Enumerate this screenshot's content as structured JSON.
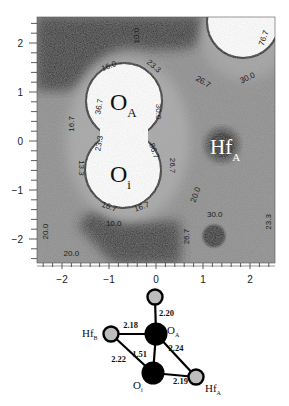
{
  "chart_data": {
    "type": "heatmap",
    "title": "",
    "xlabel": "",
    "ylabel": "",
    "xlim": [
      -2.53,
      2.53
    ],
    "ylim": [
      -2.49,
      2.53
    ],
    "x_ticks": [
      -2,
      -1,
      0,
      1,
      2
    ],
    "y_ticks": [
      2,
      1,
      0,
      -1,
      -2
    ],
    "x_tick_labels": [
      "−2",
      "−1",
      "0",
      "1",
      "2"
    ],
    "y_tick_labels": [
      "2",
      "1",
      "0",
      "−1",
      "−2"
    ],
    "minor_tick_step": 0.2,
    "colormap": "grayscale (dark = low, white = high)",
    "atoms_in_map": [
      {
        "name": "O_A",
        "label": "O",
        "subscript": "A",
        "x": -0.6,
        "y": 0.75,
        "type": "high-density-white"
      },
      {
        "name": "O_i",
        "label": "O",
        "subscript": "i",
        "x": -0.6,
        "y": -0.5,
        "type": "high-density-white"
      },
      {
        "name": "Hf_A",
        "label": "Hf",
        "subscript": "A",
        "x": 1.2,
        "y": 0.05,
        "type": "dark-core"
      },
      {
        "name": "top-right-atom",
        "label": "",
        "subscript": "",
        "x": 1.9,
        "y": 2.2,
        "type": "high-density-white"
      },
      {
        "name": "lower-right-dark-spot",
        "label": "",
        "subscript": "",
        "x": 1.2,
        "y": -1.9,
        "type": "dark-spot"
      }
    ],
    "contour_labels": [
      {
        "text": "10.0",
        "x": -0.4,
        "y": 2.15,
        "rotate": -90
      },
      {
        "text": "16.0",
        "x": -1.0,
        "y": 1.52,
        "rotate": -20
      },
      {
        "text": "23.3",
        "x": -0.05,
        "y": 1.52,
        "rotate": 40
      },
      {
        "text": "26.7",
        "x": 1.0,
        "y": 1.2,
        "rotate": 30
      },
      {
        "text": "30.0",
        "x": 1.95,
        "y": 1.28,
        "rotate": -25
      },
      {
        "text": "76.7",
        "x": 2.3,
        "y": 2.1,
        "rotate": -70
      },
      {
        "text": "30.0",
        "x": 0.05,
        "y": 0.6,
        "rotate": 90
      },
      {
        "text": "36.7",
        "x": -1.2,
        "y": 0.7,
        "rotate": -80
      },
      {
        "text": "16.7",
        "x": -1.8,
        "y": 0.35,
        "rotate": -90
      },
      {
        "text": "23.3",
        "x": -1.2,
        "y": -0.05,
        "rotate": -80
      },
      {
        "text": "86.7",
        "x": -0.05,
        "y": -0.2,
        "rotate": 70
      },
      {
        "text": "26.7",
        "x": 0.35,
        "y": -0.5,
        "rotate": 90
      },
      {
        "text": "13.3",
        "x": -1.6,
        "y": -0.55,
        "rotate": 90
      },
      {
        "text": "20.0",
        "x": 0.85,
        "y": -1.1,
        "rotate": -70
      },
      {
        "text": "30.0",
        "x": 1.25,
        "y": -1.5,
        "rotate": 0
      },
      {
        "text": "23.3",
        "x": 2.4,
        "y": -1.65,
        "rotate": -90
      },
      {
        "text": "26.7",
        "x": 0.65,
        "y": -1.95,
        "rotate": -90
      },
      {
        "text": "16.7",
        "x": -1.0,
        "y": -1.35,
        "rotate": 20
      },
      {
        "text": "16.7",
        "x": -0.3,
        "y": -1.35,
        "rotate": -20
      },
      {
        "text": "10.0",
        "x": -0.9,
        "y": -1.7,
        "rotate": 0
      },
      {
        "text": "20.0",
        "x": -2.35,
        "y": -1.85,
        "rotate": -90
      },
      {
        "text": "20.0",
        "x": -1.8,
        "y": -2.3,
        "rotate": 0
      }
    ]
  },
  "molecule": {
    "atoms": [
      {
        "id": "top",
        "label": "",
        "subscript": "",
        "color": "#bdbdbd",
        "size": "small"
      },
      {
        "id": "OA",
        "label": "O",
        "subscript": "A",
        "color": "#000000",
        "size": "large"
      },
      {
        "id": "HfB",
        "label": "Hf",
        "subscript": "B",
        "color": "#bdbdbd",
        "size": "small"
      },
      {
        "id": "Oi",
        "label": "O",
        "subscript": "i",
        "color": "#000000",
        "size": "large"
      },
      {
        "id": "HfA",
        "label": "Hf",
        "subscript": "A",
        "color": "#bdbdbd",
        "size": "small"
      }
    ],
    "bonds": [
      {
        "from": "top",
        "to": "OA",
        "length": "2.20"
      },
      {
        "from": "HfB",
        "to": "OA",
        "length": "2.18"
      },
      {
        "from": "OA",
        "to": "HfA",
        "length": "2.24"
      },
      {
        "from": "OA",
        "to": "Oi",
        "length": "1.51"
      },
      {
        "from": "HfB",
        "to": "Oi",
        "length": "2.22"
      },
      {
        "from": "Oi",
        "to": "HfA",
        "length": "2.19"
      }
    ]
  }
}
